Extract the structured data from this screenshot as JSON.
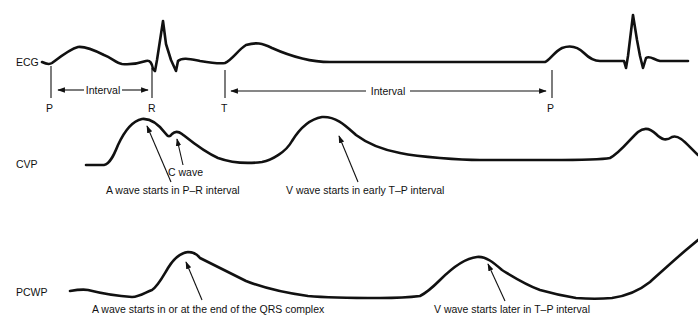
{
  "diagram": {
    "ink_color": "#111111",
    "background_color": "#ffffff",
    "rows": {
      "ecg": {
        "label": "ECG"
      },
      "cvp": {
        "label": "CVP"
      },
      "pcwp": {
        "label": "PCWP"
      }
    },
    "ecg_markers": {
      "p1": "P",
      "r": "R",
      "t": "T",
      "p2": "P"
    },
    "intervals": {
      "pr": {
        "label": "Interval",
        "from": "P",
        "to": "R"
      },
      "tp": {
        "label": "Interval",
        "from": "T",
        "to": "P"
      }
    },
    "annotations": {
      "cvp_c_wave": "C wave",
      "cvp_a_wave": "A wave starts in P–R interval",
      "cvp_v_wave": "V wave starts in early T–P interval",
      "pcwp_a_wave": "A wave starts in or at the end of the QRS complex",
      "pcwp_v_wave": "V wave starts later in T–P interval"
    }
  }
}
